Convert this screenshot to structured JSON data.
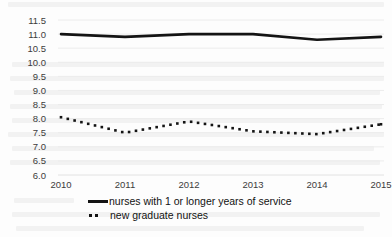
{
  "chart_data": {
    "type": "line",
    "title": "",
    "subtitle": "",
    "xlabel": "",
    "ylabel": "",
    "categories": [
      "2010",
      "2011",
      "2012",
      "2013",
      "2014",
      "2015"
    ],
    "x": [
      2010,
      2011,
      2012,
      2013,
      2014,
      2015
    ],
    "xlim": [
      2010,
      2015
    ],
    "ylim": [
      6.0,
      11.5
    ],
    "yticks": [
      6.0,
      6.5,
      7.0,
      7.5,
      8.0,
      8.5,
      9.0,
      9.5,
      10.0,
      10.5,
      11.0,
      11.5
    ],
    "ytick_labels": [
      "6.0",
      "6.5",
      "7.0",
      "7.5",
      "8.0",
      "8.5",
      "9.0",
      "9.5",
      "10.0",
      "10.5",
      "11.0",
      "11.5"
    ],
    "grid": true,
    "grid_color": "#e8e8e8",
    "legend_position": "bottom",
    "series": [
      {
        "name": "nurses with 1 or longer years of service",
        "style": "solid",
        "color": "#141414",
        "values": [
          11.0,
          10.9,
          11.0,
          11.0,
          10.8,
          10.9
        ]
      },
      {
        "name": "new graduate nurses",
        "style": "dotted",
        "color": "#141414",
        "values": [
          8.05,
          7.5,
          7.9,
          7.55,
          7.45,
          7.8
        ]
      }
    ]
  },
  "legend": {
    "items": [
      {
        "label": "nurses with 1 or longer years of service",
        "marker": "solid-line-marker"
      },
      {
        "label": "new graduate nurses",
        "marker": "dotted-line-marker"
      }
    ]
  },
  "axes": {
    "y_tick_labels": [
      "11.5",
      "11.0",
      "10.5",
      "10.0",
      "9.5",
      "9.0",
      "8.5",
      "8.0",
      "7.5",
      "7.0",
      "6.5",
      "6.0"
    ],
    "x_tick_labels": [
      "2010",
      "2011",
      "2012",
      "2013",
      "2014",
      "2015"
    ]
  }
}
